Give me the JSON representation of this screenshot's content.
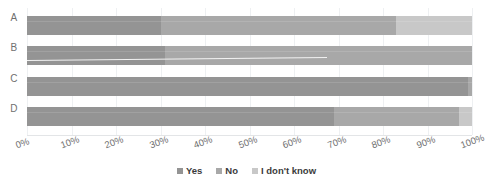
{
  "chart_data": {
    "type": "bar",
    "orientation": "horizontal",
    "stacked": true,
    "normalized": true,
    "title": "",
    "subtitle": "",
    "xlabel": "",
    "ylabel": "",
    "categories": [
      "A",
      "B",
      "C",
      "D"
    ],
    "series": [
      {
        "name": "Yes",
        "color": "#949494",
        "values": [
          30,
          31,
          99,
          69
        ]
      },
      {
        "name": "No",
        "color": "#a8a8a8",
        "values": [
          53,
          69,
          1,
          28
        ]
      },
      {
        "name": "I don't know",
        "color": "#c8c8c8",
        "values": [
          17,
          0,
          0,
          3
        ]
      }
    ],
    "xlim": [
      0,
      100
    ],
    "xticks": [
      0,
      10,
      20,
      30,
      40,
      50,
      60,
      70,
      80,
      90,
      100
    ],
    "xtick_labels": [
      "0%",
      "10%",
      "20%",
      "30%",
      "40%",
      "50%",
      "60%",
      "70%",
      "80%",
      "90%",
      "100%"
    ],
    "grid": true,
    "grid_axis": "x",
    "legend": [
      "Yes",
      "No",
      "I don't know"
    ],
    "legend_position": "bottom-center"
  },
  "axis": {
    "tick_labels": [
      "0%",
      "10%",
      "20%",
      "30%",
      "40%",
      "50%",
      "60%",
      "70%",
      "80%",
      "90%",
      "100%"
    ]
  },
  "categories": {
    "a": "A",
    "b": "B",
    "c": "C",
    "d": "D"
  },
  "legend": {
    "items": [
      {
        "label": "Yes",
        "color": "#949494"
      },
      {
        "label": "No",
        "color": "#a8a8a8"
      },
      {
        "label": "I don't know",
        "color": "#c8c8c8"
      }
    ]
  },
  "colors": {
    "yes": "#949494",
    "no": "#a8a8a8",
    "idk": "#c8c8c8",
    "grid": "#eef0f2",
    "text": "#6f6f6f",
    "legend_text": "#3b3b3b",
    "background": "#ffffff"
  }
}
